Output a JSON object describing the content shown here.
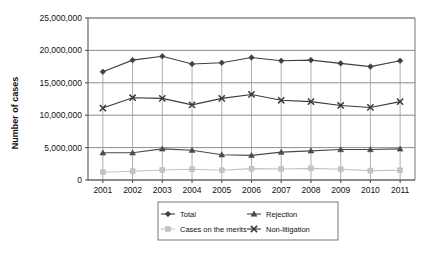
{
  "chart_data": {
    "type": "line",
    "title": "",
    "xlabel": "",
    "ylabel": "Number of cases",
    "x": [
      2001,
      2002,
      2003,
      2004,
      2005,
      2006,
      2007,
      2008,
      2009,
      2010,
      2011
    ],
    "categories": [
      "2001",
      "2002",
      "2003",
      "2004",
      "2005",
      "2006",
      "2007",
      "2008",
      "2009",
      "2010",
      "2011"
    ],
    "ylim": [
      0,
      25000000
    ],
    "yticks": [
      0,
      5000000,
      10000000,
      15000000,
      20000000,
      25000000
    ],
    "ytick_labels": [
      "0",
      "5,000,000",
      "10,000,000",
      "15,000,000",
      "20,000,000",
      "25,000,000"
    ],
    "grid": true,
    "grid_axis": "y",
    "legend_position": "bottom",
    "legend_columns": 2,
    "series": [
      {
        "name": "Total",
        "marker": "diamond",
        "color": "#404040",
        "values": [
          16700000,
          18500000,
          19100000,
          17900000,
          18100000,
          18900000,
          18400000,
          18500000,
          18000000,
          17500000,
          18400000
        ]
      },
      {
        "name": "Rejection",
        "marker": "triangle",
        "color": "#4a4a4a",
        "values": [
          4200000,
          4200000,
          4800000,
          4600000,
          3900000,
          3800000,
          4300000,
          4500000,
          4700000,
          4700000,
          4800000
        ]
      },
      {
        "name": "Cases on the merits",
        "marker": "square",
        "color": "#c2c2c2",
        "values": [
          1200000,
          1350000,
          1550000,
          1650000,
          1500000,
          1750000,
          1700000,
          1800000,
          1650000,
          1450000,
          1500000
        ]
      },
      {
        "name": "Non-litigation",
        "marker": "x-cross",
        "color": "#3a3a3a",
        "values": [
          11100000,
          12700000,
          12600000,
          11600000,
          12600000,
          13200000,
          12300000,
          12100000,
          11500000,
          11200000,
          12100000
        ]
      }
    ]
  },
  "axis": {
    "ylabel": "Number of cases"
  },
  "legend": {
    "items": [
      {
        "label": "Total",
        "marker": "diamond-marker-icon"
      },
      {
        "label": "Rejection",
        "marker": "triangle-marker-icon"
      },
      {
        "label": "Cases on the merits",
        "marker": "square-marker-icon"
      },
      {
        "label": "Non-litigation",
        "marker": "x-cross-marker-icon"
      }
    ]
  },
  "colors": {
    "total": "#404040",
    "rejection": "#4a4a4a",
    "merits": "#c2c2c2",
    "nonlitigation": "#3a3a3a",
    "grid": "#808080",
    "axis": "#555555",
    "background": "#ffffff"
  }
}
